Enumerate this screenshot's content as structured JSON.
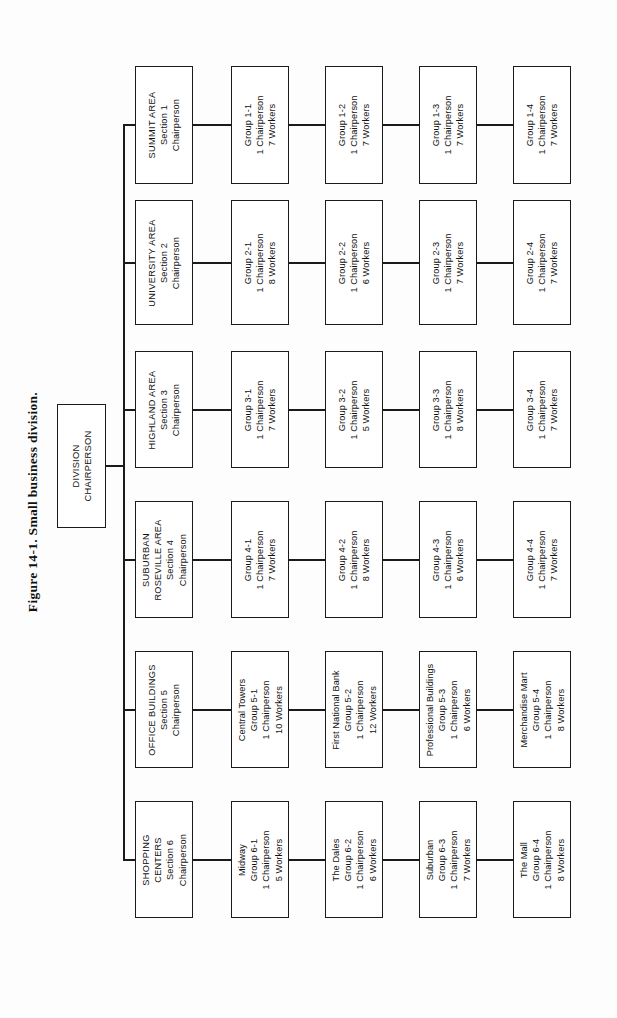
{
  "figure": {
    "caption": "Figure 14-1.  Small business division."
  },
  "chart_data": {
    "type": "diagram",
    "diagram_type": "organization-chart",
    "orientation": "rotated-90-counterclockwise",
    "title": "Figure 14-1.  Small business division.",
    "root": {
      "lines": [
        "DIVISION",
        "CHAIRPERSON"
      ]
    },
    "sections": [
      {
        "name": "SUMMIT AREA",
        "lines": [
          "SUMMIT AREA",
          "Section 1",
          "Chairperson"
        ],
        "groups": [
          {
            "lines": [
              "Group 1-1",
              "1 Chairperson",
              "7 Workers"
            ],
            "group": "1-1",
            "chairpersons": 1,
            "workers": 7
          },
          {
            "lines": [
              "Group 1-2",
              "1 Chairperson",
              "7 Workers"
            ],
            "group": "1-2",
            "chairpersons": 1,
            "workers": 7
          },
          {
            "lines": [
              "Group 1-3",
              "1 Chairperson",
              "7 Workers"
            ],
            "group": "1-3",
            "chairpersons": 1,
            "workers": 7
          },
          {
            "lines": [
              "Group 1-4",
              "1 Chairperson",
              "7 Workers"
            ],
            "group": "1-4",
            "chairpersons": 1,
            "workers": 7
          }
        ]
      },
      {
        "name": "UNIVERSITY AREA",
        "lines": [
          "UNIVERSITY AREA",
          "Section 2",
          "Chairperson"
        ],
        "groups": [
          {
            "lines": [
              "Group 2-1",
              "1 Chairperson",
              "8 Workers"
            ],
            "group": "2-1",
            "chairpersons": 1,
            "workers": 8
          },
          {
            "lines": [
              "Group 2-2",
              "1 Chairperson",
              "6 Workers"
            ],
            "group": "2-2",
            "chairpersons": 1,
            "workers": 6
          },
          {
            "lines": [
              "Group 2-3",
              "1 Chairperson",
              "7 Workers"
            ],
            "group": "2-3",
            "chairpersons": 1,
            "workers": 7
          },
          {
            "lines": [
              "Group 2-4",
              "1 Chairperson",
              "7 Workers"
            ],
            "group": "2-4",
            "chairpersons": 1,
            "workers": 7
          }
        ]
      },
      {
        "name": "HIGHLAND AREA",
        "lines": [
          "HIGHLAND AREA",
          "Section 3",
          "Chairperson"
        ],
        "groups": [
          {
            "lines": [
              "Group 3-1",
              "1 Chairperson",
              "7 Workers"
            ],
            "group": "3-1",
            "chairpersons": 1,
            "workers": 7
          },
          {
            "lines": [
              "Group 3-2",
              "1 Chairperson",
              "5 Workers"
            ],
            "group": "3-2",
            "chairpersons": 1,
            "workers": 5
          },
          {
            "lines": [
              "Group 3-3",
              "1 Chairperson",
              "8 Workers"
            ],
            "group": "3-3",
            "chairpersons": 1,
            "workers": 8
          },
          {
            "lines": [
              "Group 3-4",
              "1 Chairperson",
              "7 Workers"
            ],
            "group": "3-4",
            "chairpersons": 1,
            "workers": 7
          }
        ]
      },
      {
        "name": "SUBURBAN ROSEVILLE AREA",
        "lines": [
          "SUBURBAN",
          "ROSEVILLE AREA",
          "Section 4",
          "Chairperson"
        ],
        "groups": [
          {
            "lines": [
              "Group 4-1",
              "1 Chairperson",
              "7 Workers"
            ],
            "group": "4-1",
            "chairpersons": 1,
            "workers": 7
          },
          {
            "lines": [
              "Group 4-2",
              "1 Chairperson",
              "8 Workers"
            ],
            "group": "4-2",
            "chairpersons": 1,
            "workers": 8
          },
          {
            "lines": [
              "Group 4-3",
              "1 Chairperson",
              "6 Workers"
            ],
            "group": "4-3",
            "chairpersons": 1,
            "workers": 6
          },
          {
            "lines": [
              "Group 4-4",
              "1 Chairperson",
              "7 Workers"
            ],
            "group": "4-4",
            "chairpersons": 1,
            "workers": 7
          }
        ]
      },
      {
        "name": "OFFICE BUILDINGS",
        "lines": [
          "OFFICE BUILDINGS",
          "Section 5",
          "Chairperson"
        ],
        "groups": [
          {
            "lines": [
              "Central Towers",
              "Group 5-1",
              "1 Chairperson",
              "10 Workers"
            ],
            "group": "5-1",
            "chairpersons": 1,
            "workers": 10
          },
          {
            "lines": [
              "First National Bank",
              "Group 5-2",
              "1 Chairperson",
              "12 Workers"
            ],
            "group": "5-2",
            "chairpersons": 1,
            "workers": 12
          },
          {
            "lines": [
              "Professional Buildings",
              "Group 5-3",
              "1 Chairperson",
              "6 Workers"
            ],
            "group": "5-3",
            "chairpersons": 1,
            "workers": 6
          },
          {
            "lines": [
              "Merchandise Mart",
              "Group 5-4",
              "1 Chairperson",
              "8 Workers"
            ],
            "group": "5-4",
            "chairpersons": 1,
            "workers": 8
          }
        ]
      },
      {
        "name": "SHOPPING CENTERS",
        "lines": [
          "SHOPPING",
          "CENTERS",
          "Section 6",
          "Chairperson"
        ],
        "groups": [
          {
            "lines": [
              "Midway",
              "Group 6-1",
              "1 Chairperson",
              "5 Workers"
            ],
            "group": "6-1",
            "chairpersons": 1,
            "workers": 5
          },
          {
            "lines": [
              "The Dales",
              "Group 6-2",
              "1 Chairperson",
              "6 Workers"
            ],
            "group": "6-2",
            "chairpersons": 1,
            "workers": 6
          },
          {
            "lines": [
              "Suburban",
              "Group 6-3",
              "1 Chairperson",
              "7 Workers"
            ],
            "group": "6-3",
            "chairpersons": 1,
            "workers": 7
          },
          {
            "lines": [
              "The Mall",
              "Group 6-4",
              "1 Chairperson",
              "8 Workers"
            ],
            "group": "6-4",
            "chairpersons": 1,
            "workers": 8
          }
        ]
      }
    ],
    "colors": {
      "box_border": "#1b1b1b",
      "box_fill": "#ffffff",
      "text": "#121212",
      "page": "#fdfdfd"
    }
  },
  "layout": {
    "sections_top": [
      66,
      200,
      351,
      501,
      651,
      801
    ],
    "section_heights": [
      118,
      125,
      117,
      117,
      117,
      117
    ],
    "group_columns_left": [
      231,
      325,
      419,
      513
    ],
    "group_width": 58,
    "section_left": 135,
    "trunk_x": 123
  }
}
